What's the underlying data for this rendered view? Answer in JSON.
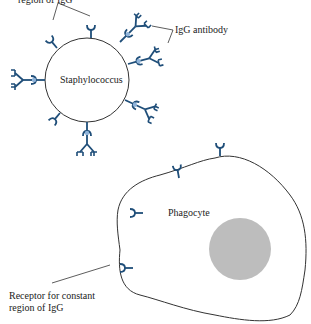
{
  "diagram": {
    "labels": {
      "top_label_line2": "region of IgG",
      "igg_antibody": "IgG antibody",
      "staphylococcus": "Staphylococcus",
      "phagocyte": "Phagocyte",
      "receptor_line1": "Receptor for constant",
      "receptor_line2": "region of IgG"
    },
    "colors": {
      "antibody": "#1f4e79",
      "receptor": "#1f4e79",
      "fc_bind": "#8fb3d9",
      "outline": "#333333",
      "nucleus": "#bdbdbd"
    }
  }
}
